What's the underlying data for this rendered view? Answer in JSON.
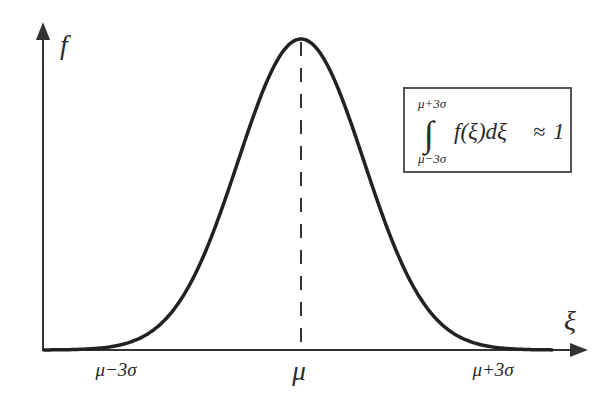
{
  "figure": {
    "type": "normal-distribution-diagram",
    "colors": {
      "curve": "#222222",
      "axes": "#333333",
      "text": "#2a2a2a",
      "box_border": "#444444",
      "background": "#ffffff"
    },
    "y_axis_label": "f",
    "x_axis_label": "ξ",
    "x_ticks": [
      {
        "label": "μ−3σ",
        "position": "mu-3sigma"
      },
      {
        "label": "μ",
        "position": "mu"
      },
      {
        "label": "μ+3σ",
        "position": "mu+3sigma"
      }
    ],
    "mean_line": {
      "style": "dashed",
      "at": "μ"
    },
    "curve": {
      "shape": "gaussian",
      "mean": "μ",
      "std": "σ"
    },
    "annotation": {
      "upper_limit": "μ+3σ",
      "integral_sign": "∫",
      "lower_limit": "μ−3σ",
      "integrand": "f(ξ)dξ",
      "relation": "≈",
      "value": "1"
    }
  }
}
